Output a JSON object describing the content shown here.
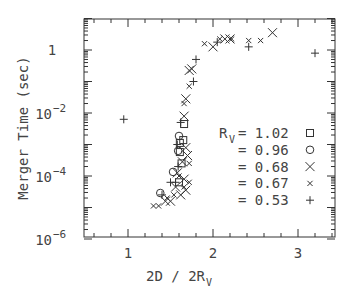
{
  "chart_data": {
    "type": "scatter",
    "title": "",
    "xlabel": "2D / 2R",
    "xlabel_sub": "V",
    "ylabel": "Merger Time (sec)",
    "xlim": [
      0.5,
      3.45
    ],
    "ylim_log10": [
      -6,
      1
    ],
    "yscale": "log",
    "grid": false,
    "x_ticks": [
      {
        "v": 1,
        "label": "1"
      },
      {
        "v": 2,
        "label": "2"
      },
      {
        "v": 3,
        "label": "3"
      }
    ],
    "y_ticks": [
      {
        "exp": 0,
        "base": "1",
        "sup": ""
      },
      {
        "exp": -2,
        "base": "10",
        "sup": "−2"
      },
      {
        "exp": -4,
        "base": "10",
        "sup": "−4"
      },
      {
        "exp": -6,
        "base": "10",
        "sup": "−6"
      }
    ],
    "legend": {
      "position": "inside-right",
      "prefix": "R",
      "prefix_sub": "V",
      "entries": [
        {
          "name": "= 1.02",
          "value": "1.02",
          "marker": "square"
        },
        {
          "name": "= 0.96",
          "value": "0.96",
          "marker": "circle"
        },
        {
          "name": "= 0.68",
          "value": "0.68",
          "marker": "x-large"
        },
        {
          "name": "= 0.67",
          "value": "0.67",
          "marker": "x-small"
        },
        {
          "name": "= 0.53",
          "value": "0.53",
          "marker": "plus"
        }
      ]
    },
    "series": [
      {
        "name": "R_V = 1.02",
        "marker": "square",
        "points": [
          [
            1.65,
            -2.86
          ],
          [
            1.61,
            -2.95
          ],
          [
            1.61,
            -3.24
          ],
          [
            1.66,
            -2.35
          ],
          [
            1.63,
            -3.6
          ],
          [
            1.6,
            -4.2
          ]
        ]
      },
      {
        "name": "R_V = 0.96",
        "marker": "circle",
        "points": [
          [
            1.6,
            -2.73
          ],
          [
            1.59,
            -3.2
          ],
          [
            1.53,
            -3.87
          ],
          [
            1.38,
            -4.54
          ]
        ]
      },
      {
        "name": "R_V = 0.68",
        "marker": "x-large",
        "points": [
          [
            2.7,
            0.55
          ],
          [
            2.0,
            0.1
          ],
          [
            2.14,
            0.35
          ],
          [
            2.2,
            0.35
          ],
          [
            1.75,
            -0.6
          ],
          [
            1.72,
            -0.65
          ],
          [
            1.68,
            -1.55
          ],
          [
            1.66,
            -2.1
          ],
          [
            1.68,
            -3.1
          ],
          [
            1.7,
            -3.35
          ],
          [
            1.64,
            -3.55
          ],
          [
            1.58,
            -3.9
          ],
          [
            1.66,
            -4.1
          ],
          [
            1.68,
            -4.45
          ],
          [
            1.56,
            -4.35
          ],
          [
            1.5,
            -4.8
          ],
          [
            1.44,
            -4.8
          ],
          [
            1.62,
            -4.6
          ]
        ]
      },
      {
        "name": "R_V = 0.67",
        "marker": "x-small",
        "points": [
          [
            1.9,
            0.2
          ],
          [
            2.08,
            0.35
          ],
          [
            2.22,
            0.35
          ],
          [
            2.42,
            0.3
          ],
          [
            2.56,
            0.3
          ],
          [
            1.72,
            -1.15
          ],
          [
            1.66,
            -1.7
          ],
          [
            1.72,
            -3.6
          ],
          [
            1.6,
            -4.0
          ],
          [
            1.72,
            -4.2
          ],
          [
            1.3,
            -4.95
          ],
          [
            1.36,
            -4.95
          ],
          [
            1.46,
            -4.7
          ],
          [
            1.54,
            -4.6
          ],
          [
            1.66,
            -4.35
          ]
        ]
      },
      {
        "name": "R_V = 0.53",
        "marker": "plus",
        "points": [
          [
            3.2,
            -0.1
          ],
          [
            0.95,
            -2.2
          ],
          [
            2.42,
            0.1
          ],
          [
            2.05,
            0.25
          ],
          [
            1.8,
            -0.3
          ],
          [
            1.77,
            -1.0
          ],
          [
            1.62,
            -2.3
          ],
          [
            1.58,
            -3.0
          ],
          [
            1.59,
            -3.7
          ],
          [
            1.5,
            -4.2
          ],
          [
            1.56,
            -4.2
          ],
          [
            1.4,
            -4.6
          ]
        ]
      }
    ]
  }
}
